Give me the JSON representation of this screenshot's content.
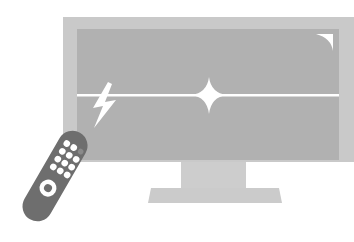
{
  "illustration": {
    "subject": "television with remote control",
    "colors": {
      "background": "#ffffff",
      "tv_frame": "#c9c9c9",
      "tv_screen": "#b1b1b1",
      "stand": "#cccccc",
      "remote_body": "#6e6e6e",
      "remote_buttons": "#ffffff",
      "remote_led": "#8a8a8a",
      "highlight": "#ffffff"
    },
    "icons": {
      "tv": "tv-icon",
      "remote": "remote-control-icon",
      "lightning": "lightning-bolt-icon",
      "sparkle": "sparkle-icon",
      "glare": "screen-glare-icon"
    },
    "remote_buttons": {
      "rows": [
        3,
        3,
        3,
        3
      ],
      "main_button": "ring"
    }
  }
}
